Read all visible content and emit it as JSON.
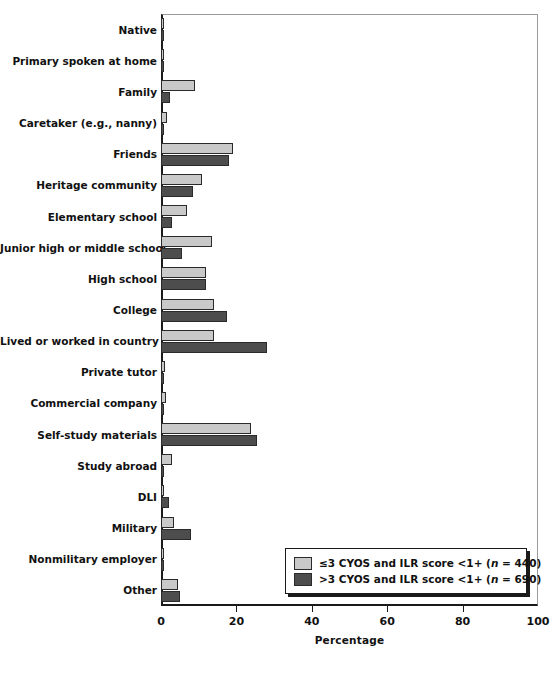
{
  "chart_data": {
    "type": "bar",
    "orientation": "horizontal",
    "title": "",
    "xlabel": "Percentage",
    "ylabel": "",
    "xlim": [
      0,
      100
    ],
    "xticks": [
      0,
      20,
      40,
      60,
      80,
      100
    ],
    "grid": false,
    "legend_position": "bottom-right",
    "categories": [
      "Native",
      "Primary spoken at home",
      "Family",
      "Caretaker (e.g., nanny)",
      "Friends",
      "Heritage community",
      "Elementary school",
      "Junior high or middle school",
      "High school",
      "College",
      "Lived or worked in country",
      "Private tutor",
      "Commercial company",
      "Self-study materials",
      "Study abroad",
      "DLI",
      "Military",
      "Nonmilitary employer",
      "Other"
    ],
    "series": [
      {
        "name": "≤3 CYOS and ILR score <1+ (n = 440)",
        "color": "#c9c9c9",
        "values": [
          0.3,
          0.5,
          9.0,
          1.5,
          19.0,
          11.0,
          7.0,
          13.5,
          12.0,
          14.0,
          14.0,
          1.0,
          1.2,
          24.0,
          2.8,
          0.2,
          3.5,
          0.2,
          4.5
        ]
      },
      {
        "name": ">3 CYOS and ILR score <1+ (n = 690)",
        "color": "#4d4d4d",
        "values": [
          0.3,
          0.7,
          2.5,
          0.2,
          18.0,
          8.5,
          3.0,
          5.5,
          12.0,
          17.5,
          28.0,
          0.2,
          0.2,
          25.5,
          0.1,
          2.0,
          8.0,
          0.8,
          5.0
        ]
      }
    ]
  },
  "legend": {
    "entries": [
      {
        "swatch": "light-gray-swatch",
        "prefix": "≤3 CYOS and ILR score <1+ (",
        "italic": "n",
        "suffix": " = 440)"
      },
      {
        "swatch": "dark-gray-swatch",
        "prefix": ">3 CYOS and ILR score <1+ (",
        "italic": "n",
        "suffix": " = 690)"
      }
    ]
  },
  "axis": {
    "x_title": "Percentage",
    "x_tick_labels": [
      "0",
      "20",
      "40",
      "60",
      "80",
      "100"
    ]
  },
  "colors": {
    "series_light": "#c9c9c9",
    "series_dark": "#4d4d4d",
    "axis": "#1a1a1a",
    "background": "#ffffff"
  }
}
